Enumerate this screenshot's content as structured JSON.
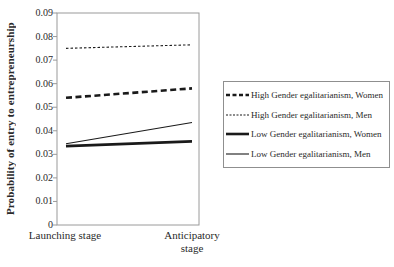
{
  "chart_data": {
    "type": "line",
    "title": "",
    "xlabel": "",
    "ylabel": "Probability of entry to entrepreneurship",
    "x_categories": [
      "Launching stage",
      "Anticipatory stage"
    ],
    "y_ticks": [
      "0",
      "0.01",
      "0.02",
      "0.03",
      "0.04",
      "0.05",
      "0.06",
      "0.07",
      "0.08",
      "0.09"
    ],
    "ylim": [
      0,
      0.09
    ],
    "grid": false,
    "legend_position": "right",
    "series": [
      {
        "name": "High Gender egalitarianism, Women",
        "values": [
          0.054,
          0.058
        ],
        "style": "dashed",
        "weight": "thick"
      },
      {
        "name": "High Gender egalitarianism, Men",
        "values": [
          0.075,
          0.0765
        ],
        "style": "dashed",
        "weight": "thin"
      },
      {
        "name": "Low Gender egalitarianism, Women",
        "values": [
          0.0335,
          0.0355
        ],
        "style": "solid",
        "weight": "thick"
      },
      {
        "name": "Low Gender egalitarianism, Men",
        "values": [
          0.0345,
          0.0435
        ],
        "style": "solid",
        "weight": "thin"
      }
    ],
    "colors": {
      "line": "#1a1a1a",
      "frame": "#9a9a9a",
      "text": "#2a2a2a"
    }
  }
}
